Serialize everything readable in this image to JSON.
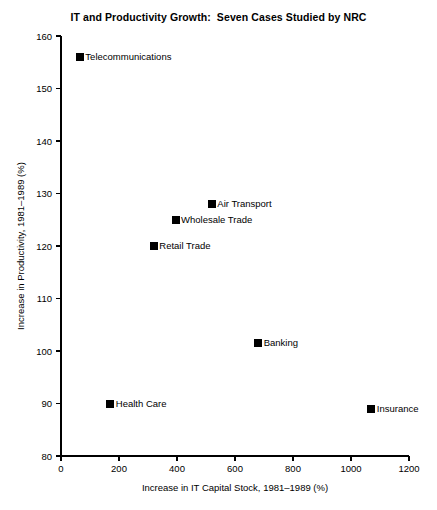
{
  "chart_data": {
    "type": "scatter",
    "title": "IT and Productivity Growth:  Seven Cases Studied by NRC",
    "xlabel": "Increase in IT Capital Stock, 1981–1989 (%)",
    "ylabel": "Increase in Productivity, 1981–1989 (%)",
    "xlim": [
      0,
      1200
    ],
    "ylim": [
      80,
      160
    ],
    "xticks": [
      0,
      200,
      400,
      600,
      800,
      1000,
      1200
    ],
    "yticks": [
      80,
      90,
      100,
      110,
      120,
      130,
      140,
      150,
      160
    ],
    "xtick_labels": [
      "0",
      "200",
      "400",
      "600",
      "800",
      "1000",
      "1200"
    ],
    "ytick_labels": [
      "80",
      "90",
      "100",
      "110",
      "120",
      "130",
      "140",
      "150",
      "160"
    ],
    "grid": false,
    "legend": "none",
    "marker": "square",
    "marker_color": "#000000",
    "points": [
      {
        "label": "Telecommunications",
        "x": 65,
        "y": 156
      },
      {
        "label": "Air Transport",
        "x": 520,
        "y": 128
      },
      {
        "label": "Wholesale Trade",
        "x": 395,
        "y": 125
      },
      {
        "label": "Retail Trade",
        "x": 320,
        "y": 120
      },
      {
        "label": "Banking",
        "x": 680,
        "y": 101.5
      },
      {
        "label": "Health Care",
        "x": 170,
        "y": 90
      },
      {
        "label": "Insurance",
        "x": 1070,
        "y": 89
      }
    ]
  }
}
